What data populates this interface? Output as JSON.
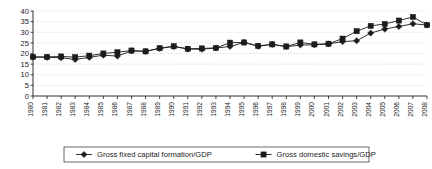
{
  "chart_data": {
    "type": "line",
    "title": "",
    "xlabel": "",
    "ylabel": "",
    "ylim": [
      0,
      40
    ],
    "yticks": [
      0,
      5,
      10,
      15,
      20,
      25,
      30,
      35,
      40
    ],
    "grid": true,
    "legend_position": "bottom",
    "categories": [
      "1980",
      "1981",
      "1982",
      "1983",
      "1984",
      "1985",
      "1986",
      "1987",
      "1988",
      "1989",
      "1990",
      "1991",
      "1992",
      "1993",
      "1994",
      "1995",
      "1996",
      "1997",
      "1998",
      "1999",
      "2000",
      "2001",
      "2002",
      "2003",
      "2004",
      "2005",
      "2006",
      "2007",
      "2008"
    ],
    "series": [
      {
        "name": "Gross fixed capital formation/GDP",
        "marker": "diamond",
        "color": "#1c1c1c",
        "values": [
          18.3,
          18.2,
          18.0,
          17.2,
          18.2,
          19.2,
          18.8,
          21.2,
          21.0,
          22.4,
          23.3,
          22.1,
          22.0,
          22.6,
          23.3,
          25.2,
          23.4,
          24.3,
          23.2,
          24.0,
          24.1,
          24.5,
          25.6,
          26.0,
          29.6,
          31.5,
          32.7,
          34.0,
          33.4
        ]
      },
      {
        "name": "Gross domestic savings/GDP",
        "marker": "square",
        "color": "#1c1c1c",
        "values": [
          18.4,
          18.4,
          18.6,
          18.3,
          19.0,
          20.0,
          20.6,
          21.4,
          21.0,
          22.5,
          23.4,
          22.2,
          22.4,
          22.6,
          25.1,
          25.2,
          23.6,
          24.3,
          23.3,
          25.2,
          24.3,
          24.6,
          27.0,
          30.5,
          33.0,
          33.9,
          35.5,
          37.2,
          33.4
        ]
      }
    ]
  },
  "legend": {
    "items": [
      {
        "label": "Gross fixed capital formation/GDP",
        "marker": "diamond"
      },
      {
        "label": "Gross domestic savings/GDP",
        "marker": "square"
      }
    ]
  }
}
